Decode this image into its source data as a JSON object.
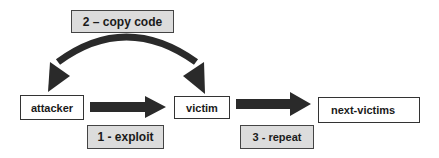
{
  "diagram": {
    "nodes": [
      {
        "id": "attacker",
        "label": "attacker"
      },
      {
        "id": "victim",
        "label": "victim"
      },
      {
        "id": "next-victims",
        "label": "next-victims"
      }
    ],
    "edge_labels": {
      "copy_code": "2 – copy code",
      "exploit": "1 - exploit",
      "repeat": "3 - repeat"
    },
    "edges": [
      {
        "from": "attacker",
        "to": "victim",
        "label": "1 - exploit",
        "style": "block-arrow"
      },
      {
        "from": "victim",
        "to": "attacker",
        "label": "2 – copy code",
        "style": "curved-double-arrow"
      },
      {
        "from": "attacker",
        "to": "victim",
        "label": "2 – copy code",
        "style": "curved-double-arrow"
      },
      {
        "from": "victim",
        "to": "next-victims",
        "label": "3 - repeat",
        "style": "block-arrow"
      }
    ],
    "colors": {
      "arrow": "#2a2a2a",
      "label_fill": "#dcdcdc",
      "node_fill": "#ffffff",
      "border": "#333333"
    }
  }
}
